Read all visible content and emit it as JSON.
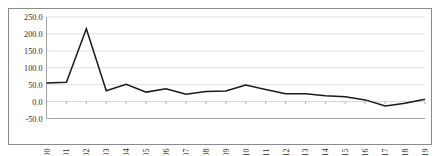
{
  "chart_data": {
    "type": "line",
    "title": "",
    "subtitle": "",
    "xlabel": "",
    "ylabel": "",
    "categories": [
      "2000",
      "2001",
      "2002",
      "2003",
      "2004",
      "2005",
      "2006",
      "2007",
      "2008",
      "2009",
      "2010",
      "2011",
      "2012",
      "2013",
      "2014",
      "2015",
      "2016",
      "2017",
      "2018",
      "2019"
    ],
    "values": [
      55.0,
      57.0,
      215.0,
      32.0,
      51.0,
      28.0,
      38.0,
      22.0,
      30.0,
      31.0,
      49.0,
      36.0,
      23.0,
      23.0,
      17.0,
      14.0,
      5.0,
      -13.0,
      -5.0,
      7.0
    ],
    "series": [
      {
        "name": "",
        "values": [
          55.0,
          57.0,
          215.0,
          32.0,
          51.0,
          28.0,
          38.0,
          22.0,
          30.0,
          31.0,
          49.0,
          36.0,
          23.0,
          23.0,
          17.0,
          14.0,
          5.0,
          -13.0,
          -5.0,
          7.0
        ]
      }
    ],
    "ylim": [
      -50.0,
      250.0
    ],
    "ytick_labels": [
      "250.0",
      "200.0",
      "150.0",
      "100.0",
      "50.0",
      "0.0",
      "-50.0"
    ],
    "ytick_values": [
      250.0,
      200.0,
      150.0,
      100.0,
      50.0,
      0.0,
      -50.0
    ],
    "xtick_labels": [
      "2000",
      "2001",
      "2002",
      "2003",
      "2004",
      "2005",
      "2006",
      "2007",
      "2008",
      "2009",
      "2010",
      "2011",
      "2012",
      "2013",
      "2014",
      "2015",
      "2016",
      "2017",
      "2018",
      "2019"
    ],
    "grid": true,
    "grid_axis": "y",
    "legend": false,
    "legend_position": "none",
    "line_color": "#1a1a1a",
    "grid_color": "#d9d9d9",
    "axis_color": "#9a9a9a",
    "background_color": "#ffffff",
    "xlabel_rotation": -90,
    "annotations": []
  },
  "figure": {
    "border_color": "#8a8a8a",
    "background_color": "#ffffff"
  }
}
